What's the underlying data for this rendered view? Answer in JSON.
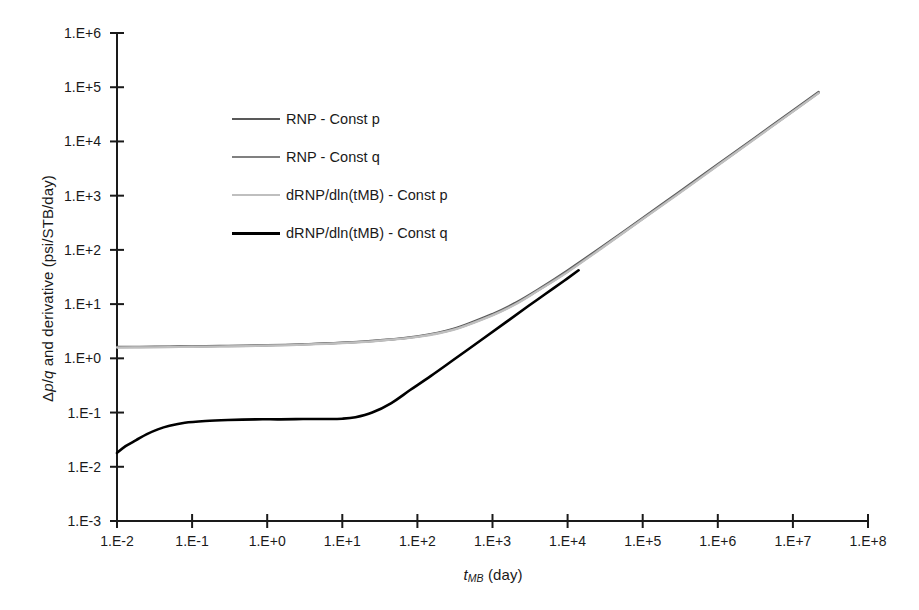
{
  "chart_data": {
    "type": "line",
    "title": "",
    "xlabel": "tMB (day)",
    "xlabel_parts": {
      "symbol": "t",
      "subscript": "MB",
      "unit": "(day)"
    },
    "ylabel": "Δp/q and derivative (psi/STB/day)",
    "ylabel_parts": {
      "delta": "Δ",
      "p": "p",
      "slash": "/",
      "q": "q",
      "rest": " and derivative (psi/STB/day)"
    },
    "xscale": "log",
    "yscale": "log",
    "xlim": [
      0.01,
      100000000
    ],
    "ylim": [
      0.001,
      1000000
    ],
    "grid": false,
    "legend_position": "upper-left-inside",
    "xticks": [
      "1.E-2",
      "1.E-1",
      "1.E+0",
      "1.E+1",
      "1.E+2",
      "1.E+3",
      "1.E+4",
      "1.E+5",
      "1.E+6",
      "1.E+7",
      "1.E+8"
    ],
    "xtick_values": [
      0.01,
      0.1,
      1,
      10,
      100,
      1000,
      10000,
      100000,
      1000000,
      10000000,
      100000000
    ],
    "yticks": [
      "1.E-3",
      "1.E-2",
      "1.E-1",
      "1.E+0",
      "1.E+1",
      "1.E+2",
      "1.E+3",
      "1.E+4",
      "1.E+5",
      "1.E+6"
    ],
    "ytick_values": [
      0.001,
      0.01,
      0.1,
      1,
      10,
      100,
      1000,
      10000,
      100000,
      1000000
    ],
    "series": [
      {
        "name": "RNP - Const p",
        "color": "#595959",
        "width": 2.2,
        "x": [
          0.01,
          0.02,
          0.05,
          0.1,
          0.3,
          1,
          3,
          10,
          30,
          100,
          300,
          1000,
          2000,
          4000,
          10000,
          30000,
          100000,
          300000,
          1000000,
          3000000,
          10000000,
          22000000
        ],
        "y": [
          1.62,
          1.63,
          1.65,
          1.67,
          1.7,
          1.75,
          1.82,
          1.95,
          2.15,
          2.55,
          3.5,
          6.6,
          10.5,
          18.5,
          42,
          120,
          390,
          1150,
          3800,
          11300,
          37500,
          82000
        ]
      },
      {
        "name": "RNP - Const q",
        "color": "#808080",
        "width": 2.2,
        "x": [
          0.01,
          0.02,
          0.05,
          0.1,
          0.3,
          1,
          3,
          10,
          30,
          100,
          300,
          1000,
          2000,
          4000,
          10000,
          30000,
          100000,
          300000,
          1000000,
          3000000,
          10000000,
          22000000
        ],
        "y": [
          1.6,
          1.61,
          1.63,
          1.65,
          1.68,
          1.73,
          1.8,
          1.92,
          2.12,
          2.5,
          3.4,
          6.3,
          10.0,
          17.8,
          40,
          115,
          375,
          1100,
          3650,
          10900,
          36000,
          79000
        ]
      },
      {
        "name": "dRNP/dln(tMB) - Const p",
        "color": "#bfbfbf",
        "width": 2.2,
        "x": [
          0.01,
          0.02,
          0.05,
          0.1,
          0.3,
          1,
          3,
          10,
          30,
          100,
          300,
          1000,
          2000,
          4000,
          10000,
          30000,
          100000,
          300000,
          1000000,
          3000000,
          10000000,
          22000000
        ],
        "y": [
          1.58,
          1.59,
          1.61,
          1.63,
          1.66,
          1.71,
          1.78,
          1.9,
          2.1,
          2.48,
          3.35,
          6.2,
          9.8,
          17.5,
          39,
          113,
          370,
          1080,
          3600,
          10700,
          35500,
          78000
        ]
      },
      {
        "name": "dRNP/dln(tMB) - Const q",
        "color": "#000000",
        "width": 2.6,
        "x": [
          0.01,
          0.013,
          0.018,
          0.025,
          0.035,
          0.05,
          0.08,
          0.15,
          0.3,
          0.7,
          1.5,
          3,
          6,
          10,
          15,
          25,
          45,
          80,
          150,
          300,
          700,
          1500,
          3000,
          5000,
          9000,
          14000
        ],
        "y": [
          0.018,
          0.024,
          0.031,
          0.04,
          0.049,
          0.057,
          0.065,
          0.07,
          0.073,
          0.075,
          0.075,
          0.076,
          0.076,
          0.077,
          0.082,
          0.1,
          0.15,
          0.26,
          0.47,
          0.93,
          2.15,
          4.6,
          9.2,
          15.2,
          27,
          42
        ]
      }
    ]
  },
  "legend": {
    "items": [
      {
        "label": "RNP - Const p",
        "color": "#595959",
        "width": 2.2
      },
      {
        "label": "RNP - Const q",
        "color": "#808080",
        "width": 2.2
      },
      {
        "label": "dRNP/dln(tMB) - Const p",
        "color": "#bfbfbf",
        "width": 2.2
      },
      {
        "label": "dRNP/dln(tMB) - Const q",
        "color": "#000000",
        "width": 3.2
      }
    ]
  }
}
